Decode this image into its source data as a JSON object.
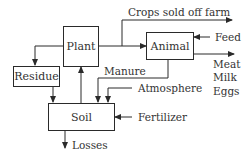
{
  "diagram": {
    "nodes": {
      "plant": {
        "label": "Plant"
      },
      "animal": {
        "label": "Animal"
      },
      "residue": {
        "label": "Residue"
      },
      "soil": {
        "label": "Soil"
      }
    },
    "labels": {
      "crops": "Crops sold off farm",
      "feed": "Feed",
      "meat": "Meat",
      "milk": "Milk",
      "eggs": "Eggs",
      "manure": "Manure",
      "atmosphere": "Atmosphere",
      "fertilizer": "Fertilizer",
      "losses": "Losses"
    },
    "edges": [
      {
        "from": "plant",
        "to": "crops-sold-off-farm"
      },
      {
        "from": "plant",
        "to": "animal"
      },
      {
        "from": "feed",
        "to": "animal"
      },
      {
        "from": "animal",
        "to": "meat-milk-eggs"
      },
      {
        "from": "plant",
        "to": "residue"
      },
      {
        "from": "residue",
        "to": "soil"
      },
      {
        "from": "soil",
        "to": "plant"
      },
      {
        "from": "animal",
        "to": "soil",
        "label": "Manure"
      },
      {
        "from": "atmosphere",
        "to": "soil"
      },
      {
        "from": "fertilizer",
        "to": "soil"
      },
      {
        "from": "soil",
        "to": "losses"
      }
    ],
    "colors": {
      "stroke": "#2a2a2a",
      "text": "#333333",
      "background": "#ffffff"
    }
  }
}
